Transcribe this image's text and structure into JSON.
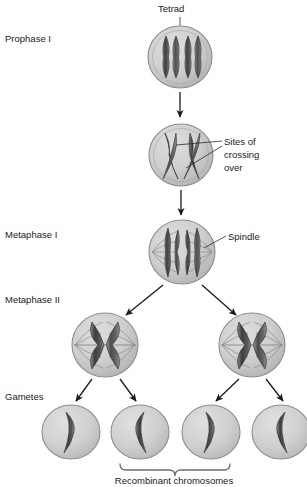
{
  "figure": {
    "width": 307,
    "height": 487,
    "background": "#ffffff"
  },
  "colors": {
    "background": "#ffffff",
    "cell_fill": "#c8c8c8",
    "cell_fill_light": "#d8d8d8",
    "cell_edge": "#8d8d8d",
    "chromosome_dark": "#4a4a4a",
    "chromosome_mid": "#6b6b6b",
    "chromosome_light": "#8f8f8f",
    "text": "#1a1a1a",
    "leader_line": "#2b2b2b",
    "brace": "#6e6e6e",
    "spindle": "#8a8a8a"
  },
  "stage_labels": [
    {
      "id": "prophase-i",
      "text": "Prophase I",
      "x": 5,
      "y": 42
    },
    {
      "id": "metaphase-i",
      "text": "Metaphase I",
      "x": 5,
      "y": 238
    },
    {
      "id": "metaphase-ii",
      "text": "Metaphase II",
      "x": 5,
      "y": 303
    },
    {
      "id": "gametes",
      "text": "Gametes",
      "x": 5,
      "y": 400
    }
  ],
  "callouts": [
    {
      "id": "tetrad",
      "text": "Tetrad",
      "lines": [
        "Tetrad"
      ],
      "x": 158,
      "y": 12
    },
    {
      "id": "sites-of-crossing-over",
      "text": "Sites of crossing over",
      "lines": [
        "Sites of",
        "crossing",
        "over"
      ],
      "x": 224,
      "y": 142
    },
    {
      "id": "spindle",
      "text": "Spindle",
      "lines": [
        "Spindle"
      ],
      "x": 228,
      "y": 240
    }
  ],
  "caption": {
    "id": "recombinant-chromosomes",
    "text": "Recombinant chromosomes",
    "x": 174,
    "y": 482
  },
  "cells": [
    {
      "id": "prophase-i-cell",
      "stage": "Prophase I",
      "cx": 180,
      "cy": 57,
      "rx": 32,
      "ry": 31,
      "contents": "tetrad of four chromatids",
      "chromosome_count": 4,
      "has_spindle": false
    },
    {
      "id": "crossing-over-cell",
      "stage": "Prophase I crossing over",
      "cx": 181,
      "cy": 155,
      "rx": 32,
      "ry": 31,
      "contents": "overlapping chromatids forming chiasmata",
      "chromosome_count": 4,
      "has_spindle": false
    },
    {
      "id": "metaphase-i-cell",
      "stage": "Metaphase I",
      "cx": 182,
      "cy": 252,
      "rx": 33,
      "ry": 32,
      "contents": "tetrad aligned at metaphase plate",
      "chromosome_count": 4,
      "has_spindle": true
    },
    {
      "id": "metaphase-ii-cell-left",
      "stage": "Metaphase II",
      "cx": 105,
      "cy": 345,
      "rx": 33,
      "ry": 32,
      "contents": "single chromosome with two chromatids",
      "chromosome_count": 2,
      "has_spindle": true
    },
    {
      "id": "metaphase-ii-cell-right",
      "stage": "Metaphase II",
      "cx": 252,
      "cy": 345,
      "rx": 33,
      "ry": 32,
      "contents": "single chromosome with two chromatids",
      "chromosome_count": 2,
      "has_spindle": true
    },
    {
      "id": "gamete-cell-1",
      "stage": "Gametes",
      "cx": 71,
      "cy": 432,
      "rx": 29,
      "ry": 27,
      "contents": "single bent chromatid",
      "chromosome_count": 1,
      "has_spindle": false,
      "recombinant": false
    },
    {
      "id": "gamete-cell-2",
      "stage": "Gametes",
      "cx": 140,
      "cy": 432,
      "rx": 29,
      "ry": 27,
      "contents": "single bent recombinant chromatid",
      "chromosome_count": 1,
      "has_spindle": false,
      "recombinant": true
    },
    {
      "id": "gamete-cell-3",
      "stage": "Gametes",
      "cx": 211,
      "cy": 432,
      "rx": 29,
      "ry": 27,
      "contents": "single bent recombinant chromatid",
      "chromosome_count": 1,
      "has_spindle": false,
      "recombinant": true
    },
    {
      "id": "gamete-cell-4",
      "stage": "Gametes",
      "cx": 281,
      "cy": 432,
      "rx": 29,
      "ry": 27,
      "contents": "single bent chromatid",
      "chromosome_count": 1,
      "has_spindle": false,
      "recombinant": false
    }
  ],
  "flow_arrows": [
    {
      "id": "arrow-prophase-to-crossover",
      "from": "prophase-i-cell",
      "to": "crossing-over-cell"
    },
    {
      "id": "arrow-crossover-to-metaphase-i",
      "from": "crossing-over-cell",
      "to": "metaphase-i-cell"
    },
    {
      "id": "arrow-metaphase-i-to-left",
      "from": "metaphase-i-cell",
      "to": "metaphase-ii-cell-left"
    },
    {
      "id": "arrow-metaphase-i-to-right",
      "from": "metaphase-i-cell",
      "to": "metaphase-ii-cell-right"
    },
    {
      "id": "arrow-left-to-gamete-1",
      "from": "metaphase-ii-cell-left",
      "to": "gamete-cell-1"
    },
    {
      "id": "arrow-left-to-gamete-2",
      "from": "metaphase-ii-cell-left",
      "to": "gamete-cell-2"
    },
    {
      "id": "arrow-right-to-gamete-3",
      "from": "metaphase-ii-cell-right",
      "to": "gamete-cell-3"
    },
    {
      "id": "arrow-right-to-gamete-4",
      "from": "metaphase-ii-cell-right",
      "to": "gamete-cell-4"
    }
  ],
  "brace": {
    "id": "recombinant-brace",
    "left_x": 120,
    "right_x": 230,
    "y": 466,
    "covers": [
      "gamete-cell-2",
      "gamete-cell-3"
    ]
  }
}
